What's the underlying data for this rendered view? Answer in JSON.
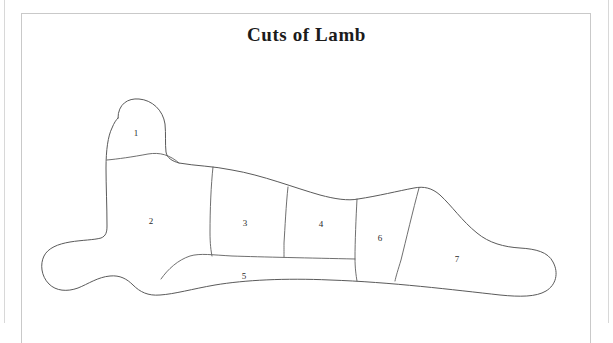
{
  "document": {
    "title": "Cuts of Lamb",
    "background_color": "#ffffff",
    "frame_color": "#c9c9c9",
    "outline_color": "#5a5a5a",
    "label_color": "#2a2a2a"
  },
  "diagram": {
    "label_count": 7,
    "labels": [
      {
        "id": "1",
        "text": "1",
        "x": 136,
        "y": 133
      },
      {
        "id": "2",
        "text": "2",
        "x": 151,
        "y": 221
      },
      {
        "id": "3",
        "text": "3",
        "x": 245,
        "y": 223
      },
      {
        "id": "4",
        "text": "4",
        "x": 321,
        "y": 224
      },
      {
        "id": "5",
        "text": "5",
        "x": 244,
        "y": 276
      },
      {
        "id": "6",
        "text": "6",
        "x": 380,
        "y": 238
      },
      {
        "id": "7",
        "text": "7",
        "x": 457,
        "y": 259
      }
    ]
  }
}
